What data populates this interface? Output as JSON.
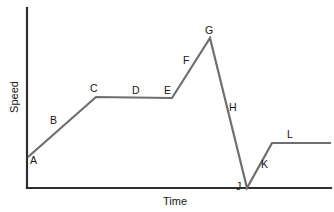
{
  "figure": {
    "width": 334,
    "height": 212,
    "background": "#ffffff",
    "line_color": "#6e6e6e",
    "axis_color": "#2f2f2f",
    "label_color": "#161616"
  },
  "axes": {
    "x_title": "Time",
    "y_title": "Speed",
    "x_axis_y": 188,
    "y_axis_x": 27,
    "x_axis_start": 27,
    "x_axis_end": 331,
    "y_axis_top": 8,
    "y_axis_bottom": 188
  },
  "chart_data": {
    "type": "line",
    "title": "",
    "xlabel": "Time",
    "ylabel": "Speed",
    "grid": false,
    "legend": "none",
    "axis_ticks": false,
    "xlim": [
      0,
      304
    ],
    "ylim": [
      0,
      180
    ],
    "series": [
      {
        "name": "speed",
        "points": [
          {
            "label": "A",
            "x": 1,
            "y": 31
          },
          {
            "label": "C",
            "x": 69,
            "y": 91
          },
          {
            "label": "E",
            "x": 145,
            "y": 90
          },
          {
            "label": "G",
            "x": 183,
            "y": 150
          },
          {
            "label": "J",
            "x": 220,
            "y": 0
          },
          {
            "label": "K",
            "x": 245,
            "y": 45
          },
          {
            "label": "L",
            "x": 304,
            "y": 45
          }
        ]
      }
    ],
    "segment_labels": [
      {
        "id": "A",
        "text": "A",
        "x": 30,
        "y": 164,
        "desc": "start of acceleration at low speed"
      },
      {
        "id": "B",
        "text": "B",
        "x": 50,
        "y": 124,
        "desc": "uniform acceleration ramp"
      },
      {
        "id": "C",
        "text": "C",
        "x": 90,
        "y": 92,
        "desc": "top of first ramp"
      },
      {
        "id": "D",
        "text": "D",
        "x": 132,
        "y": 94,
        "desc": "constant speed plateau"
      },
      {
        "id": "E",
        "text": "E",
        "x": 164,
        "y": 94,
        "desc": "end of plateau"
      },
      {
        "id": "F",
        "text": "F",
        "x": 183,
        "y": 64,
        "desc": "second acceleration ramp"
      },
      {
        "id": "G",
        "text": "G",
        "x": 205,
        "y": 34,
        "desc": "maximum speed peak"
      },
      {
        "id": "H",
        "text": "H",
        "x": 229,
        "y": 111,
        "desc": "rapid deceleration"
      },
      {
        "id": "J",
        "text": "J",
        "x": 236,
        "y": 190,
        "desc": "speed drops to zero"
      },
      {
        "id": "K",
        "text": "K",
        "x": 261,
        "y": 168,
        "desc": "acceleration from rest"
      },
      {
        "id": "L",
        "text": "L",
        "x": 287,
        "y": 138,
        "desc": "final constant speed"
      }
    ],
    "vertices_px": [
      {
        "x": 28,
        "y": 157
      },
      {
        "x": 96,
        "y": 97
      },
      {
        "x": 172,
        "y": 98
      },
      {
        "x": 210,
        "y": 38
      },
      {
        "x": 247,
        "y": 188
      },
      {
        "x": 272,
        "y": 143
      },
      {
        "x": 331,
        "y": 143
      }
    ]
  }
}
